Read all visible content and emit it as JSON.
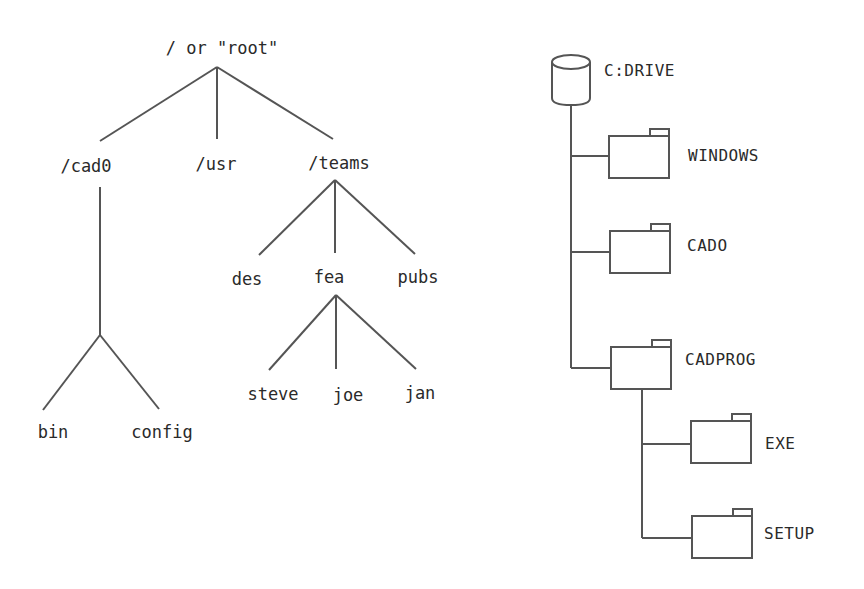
{
  "unix_tree": {
    "root": "/ or \"root\"",
    "level1": [
      "/cad0",
      "/usr",
      "/teams"
    ],
    "cad0_children": [
      "bin",
      "config"
    ],
    "teams_children": [
      "des",
      "fea",
      "pubs"
    ],
    "fea_children": [
      "steve",
      "joe",
      "jan"
    ]
  },
  "dos_tree": {
    "drive": "C:DRIVE",
    "folders": [
      "WINDOWS",
      "CADO",
      "CADPROG"
    ],
    "cadprog_children": [
      "EXE",
      "SETUP"
    ]
  },
  "colors": {
    "line": "#555555",
    "text": "#2a2a2a",
    "background": "#ffffff"
  }
}
